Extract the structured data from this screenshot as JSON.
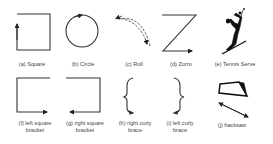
{
  "figure": {
    "gestures": [
      {
        "id": "a",
        "label": "(a) Square",
        "icon": "square-gesture"
      },
      {
        "id": "b",
        "label": "(b) Circle",
        "icon": "circle-gesture"
      },
      {
        "id": "c",
        "label": "(c) Roll",
        "icon": "roll-gesture"
      },
      {
        "id": "d",
        "label": "(d) Zorro",
        "icon": "zorro-gesture"
      },
      {
        "id": "e",
        "label": "(e) Tennis Serve",
        "icon": "tennis-serve-gesture"
      },
      {
        "id": "f",
        "label_line1": "(f) left square",
        "label_line2": "bracket",
        "icon": "left-square-bracket-gesture"
      },
      {
        "id": "g",
        "label_line1": "(g) right square",
        "label_line2": "bracket",
        "icon": "right-square-bracket-gesture"
      },
      {
        "id": "h",
        "label_line1": "(h) right curly",
        "label_line2": "brace",
        "icon": "right-curly-brace-gesture"
      },
      {
        "id": "i",
        "label_line1": "(i) left curly",
        "label_line2": "brace",
        "icon": "left-curly-brace-gesture"
      },
      {
        "id": "j",
        "label": "(j) hacksaw",
        "icon": "hacksaw-gesture"
      }
    ],
    "colors": {
      "stroke": "#333333",
      "label": "#444444",
      "background": "#ffffff"
    }
  }
}
